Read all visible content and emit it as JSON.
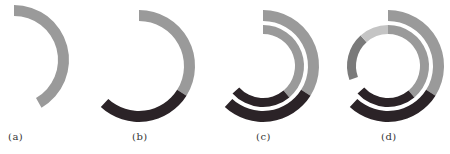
{
  "colors": {
    "gray": "#9a9a9a",
    "dark": "#2b2327",
    "mid_gray": "#7a7a7a",
    "light_gray": "#c4c4c4"
  },
  "panels": [
    {
      "label": "(a)",
      "center": [
        14,
        60
      ],
      "rings": [
        {
          "r_outer": 55,
          "r_inner": 44,
          "segments": [
            {
              "start": 0,
              "end": 150,
              "color": "gray"
            }
          ]
        }
      ]
    },
    {
      "label": "(b)",
      "center": [
        139,
        66
      ],
      "rings": [
        {
          "r_outer": 56,
          "r_inner": 45,
          "segments": [
            {
              "start": 0,
              "end": 122,
              "color": "gray"
            },
            {
              "start": 122,
              "end": 223,
              "color": "dark"
            }
          ]
        }
      ]
    },
    {
      "label": "(c)",
      "center": [
        263,
        66
      ],
      "rings": [
        {
          "r_outer": 56,
          "r_inner": 45,
          "segments": [
            {
              "start": 0,
              "end": 122,
              "color": "gray"
            },
            {
              "start": 122,
              "end": 223,
              "color": "dark"
            }
          ]
        },
        {
          "r_outer": 41,
          "r_inner": 32,
          "segments": [
            {
              "start": 0,
              "end": 140,
              "color": "gray"
            },
            {
              "start": 140,
              "end": 228,
              "color": "dark"
            }
          ]
        }
      ]
    },
    {
      "label": "(d)",
      "center": [
        388,
        66
      ],
      "rings": [
        {
          "r_outer": 56,
          "r_inner": 45,
          "segments": [
            {
              "start": 0,
              "end": 122,
              "color": "gray"
            },
            {
              "start": 122,
              "end": 223,
              "color": "dark"
            }
          ]
        },
        {
          "r_outer": 41,
          "r_inner": 32,
          "segments": [
            {
              "start": 0,
              "end": 140,
              "color": "gray"
            },
            {
              "start": 140,
              "end": 228,
              "color": "dark"
            },
            {
              "start": 250,
              "end": 318,
              "color": "mid_gray"
            },
            {
              "start": 318,
              "end": 360,
              "color": "light_gray"
            }
          ]
        }
      ]
    }
  ],
  "labels": {
    "a": "(a)",
    "b": "(b)",
    "c": "(c)",
    "d": "(d)"
  }
}
